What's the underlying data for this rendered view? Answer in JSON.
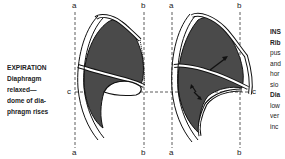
{
  "expiration": {
    "title": "EXPIRATION",
    "lines": [
      "Diaphragm",
      "relaxed—",
      "dome of dia-",
      "phragm rises"
    ]
  },
  "inspiration": {
    "title": "INS",
    "lines": [
      "Rib",
      "pus",
      "and",
      "hor",
      "sio",
      "Dia",
      "low",
      "ver",
      "inc"
    ]
  },
  "reference_lines": {
    "a": "a",
    "b": "b",
    "c": "c"
  },
  "colors": {
    "lung_fill": "#4a4a4a",
    "outline": "#111111",
    "background": "#ffffff"
  }
}
